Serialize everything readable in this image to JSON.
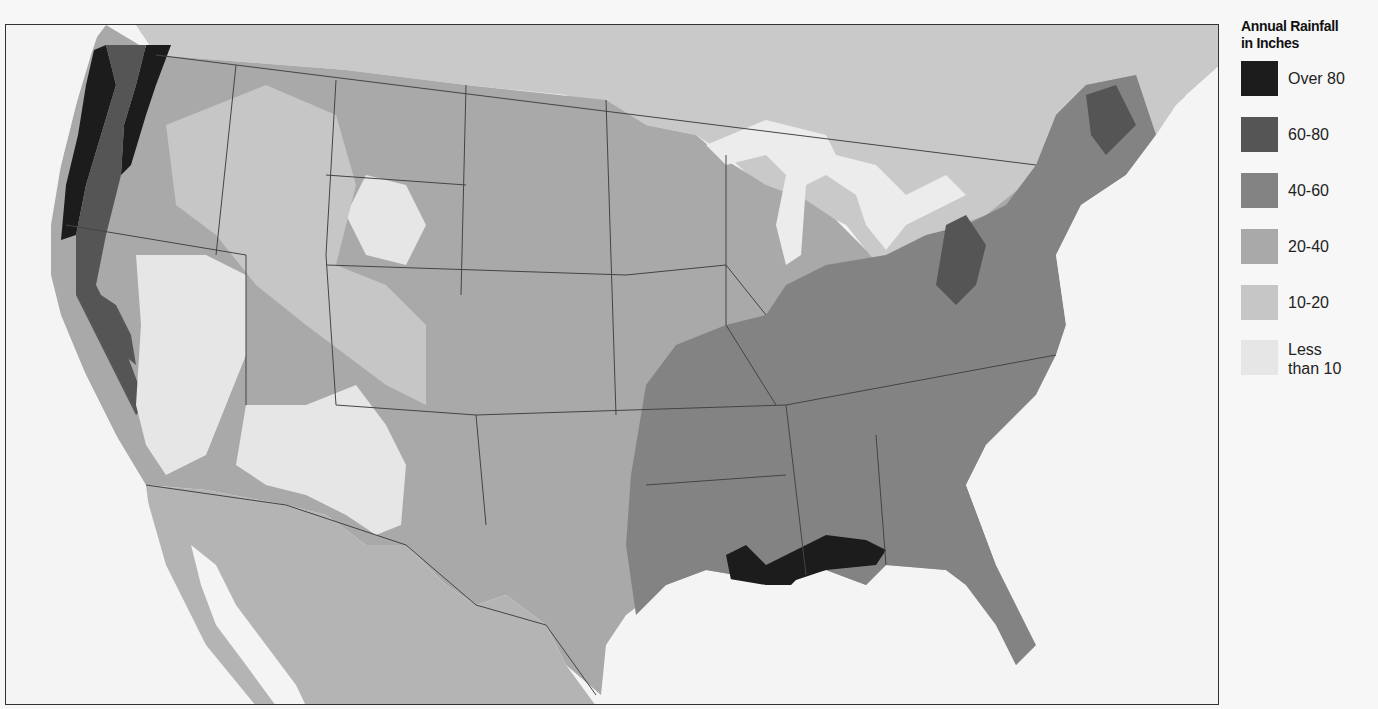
{
  "map": {
    "title": "Annual Rainfall in Inches",
    "region": "Contiguous United States with parts of Canada and Mexico",
    "type": "choropleth",
    "notable_regions": [
      {
        "area": "Pacific Northwest coast / Cascades",
        "class": "Over 80"
      },
      {
        "area": "Gulf Coast (Louisiana, Mississippi, Alabama, Florida panhandle)",
        "class": "Over 80"
      },
      {
        "area": "Southeast and East",
        "class": "40-60"
      },
      {
        "area": "Great Plains",
        "class": "20-40"
      },
      {
        "area": "Great Basin / Southwest deserts",
        "class": "Less than 10"
      }
    ]
  },
  "legend": {
    "title_line1": "Annual Rainfall",
    "title_line2": "in Inches",
    "items": [
      {
        "label": "Over 80",
        "color": "#1c1c1c"
      },
      {
        "label": "60-80",
        "color": "#555555"
      },
      {
        "label": "40-60",
        "color": "#838383"
      },
      {
        "label": "20-40",
        "color": "#a9a9a9"
      },
      {
        "label": "10-20",
        "color": "#c6c6c6"
      },
      {
        "label": "Less",
        "label2": "than 10",
        "color": "#e6e6e6"
      }
    ]
  },
  "colors": {
    "water": "#f4f4f4",
    "canada": "#c9c9c9",
    "mexico": "#b4b4b4",
    "border": "#444444"
  }
}
